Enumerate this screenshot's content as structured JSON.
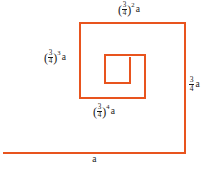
{
  "figure": {
    "type": "geometric-diagram",
    "line_color": "#e8541e",
    "text_color": "#1a1a1a",
    "background_color": "#ffffff",
    "ratio": "3/4",
    "base_length": "a"
  },
  "labels": {
    "top": {
      "name": "label-three-quarters-squared-a",
      "open_paren": "(",
      "numerator": "3",
      "denominator": "4",
      "close_paren": ")",
      "exponent": "2",
      "variable": "a",
      "plain": "(3/4)^2 a"
    },
    "left": {
      "name": "label-three-quarters-cubed-a",
      "open_paren": "(",
      "numerator": "3",
      "denominator": "4",
      "close_paren": ")",
      "exponent": "3",
      "variable": "a",
      "plain": "(3/4)^3 a"
    },
    "right": {
      "name": "label-three-quarters-a",
      "numerator": "3",
      "denominator": "4",
      "variable": "a",
      "plain": "3/4 a"
    },
    "inner": {
      "name": "label-three-quarters-fourth-a",
      "open_paren": "(",
      "numerator": "3",
      "denominator": "4",
      "close_paren": ")",
      "exponent": "4",
      "variable": "a",
      "plain": "(3/4)^4 a"
    },
    "bottom": {
      "name": "label-a",
      "variable": "a",
      "plain": "a"
    }
  },
  "geometry": {
    "stroke_width": "2",
    "spiral_path": "M 3 153 L 185 153 L 185 23 L 80 23 L 80 98 L 145 98 L 145 55 L 105 55 L 105 83 L 130 83 L 130 57",
    "segments": [
      {
        "name": "bottom-segment-a",
        "length_label": "a",
        "from": [
          3,
          153
        ],
        "to": [
          185,
          153
        ]
      },
      {
        "name": "right-segment-three-quarters",
        "length_label": "3/4 a",
        "from": [
          185,
          153
        ],
        "to": [
          185,
          23
        ]
      },
      {
        "name": "top-segment-squared",
        "length_label": "(3/4)^2 a",
        "from": [
          185,
          23
        ],
        "to": [
          80,
          23
        ]
      },
      {
        "name": "left-segment-cubed",
        "length_label": "(3/4)^3 a",
        "from": [
          80,
          23
        ],
        "to": [
          80,
          98
        ]
      },
      {
        "name": "inner-bottom-segment-fourth",
        "length_label": "(3/4)^4 a",
        "from": [
          80,
          98
        ],
        "to": [
          145,
          98
        ]
      },
      {
        "name": "inner-right-segment",
        "length_label": "",
        "from": [
          145,
          98
        ],
        "to": [
          145,
          55
        ]
      },
      {
        "name": "inner-top-segment",
        "length_label": "",
        "from": [
          145,
          55
        ],
        "to": [
          105,
          55
        ]
      },
      {
        "name": "inner-left-segment",
        "length_label": "",
        "from": [
          105,
          55
        ],
        "to": [
          105,
          83
        ]
      },
      {
        "name": "innermost-bottom-segment",
        "length_label": "",
        "from": [
          105,
          83
        ],
        "to": [
          130,
          83
        ]
      },
      {
        "name": "innermost-right-segment",
        "length_label": "",
        "from": [
          130,
          83
        ],
        "to": [
          130,
          57
        ]
      }
    ]
  }
}
